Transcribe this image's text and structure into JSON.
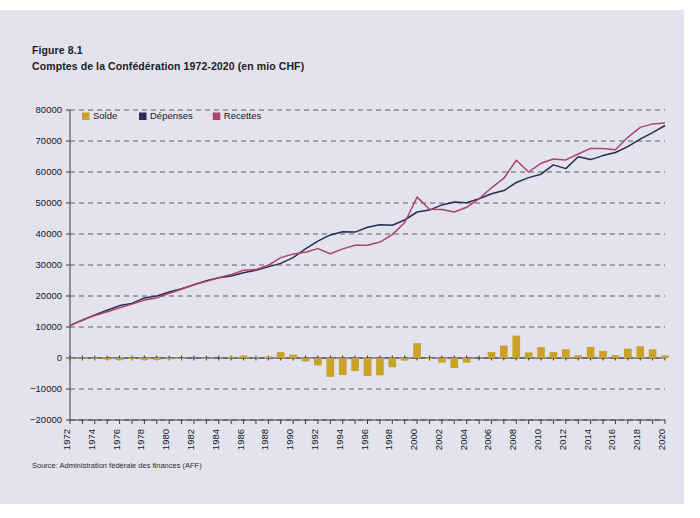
{
  "figure": {
    "label": "Figure 8.1",
    "subtitle": "Comptes de la Confédération 1972-2020 (en mio CHF)",
    "source": "Source: Administration fédérale des finances (AFF)"
  },
  "colors": {
    "solde": "#c9a227",
    "depenses": "#2b2b55",
    "recettes": "#b0436a",
    "page_background": "#e3e3ee",
    "grid": "#3a3a46"
  },
  "legend": {
    "position": "top-left",
    "items": [
      {
        "label": "Solde",
        "color": "#c9a227",
        "type": "bar"
      },
      {
        "label": "Dépenses",
        "color": "#2b2b55",
        "type": "line"
      },
      {
        "label": "Recettes",
        "color": "#b0436a",
        "type": "line"
      }
    ]
  },
  "chart_data": {
    "type": "bar",
    "title": "Comptes de la Confédération 1972-2020 (en mio CHF)",
    "xlabel": "",
    "ylabel": "",
    "ylim": [
      -20000,
      80000
    ],
    "ytick_step": 10000,
    "yticks": [
      -20000,
      -10000,
      0,
      10000,
      20000,
      30000,
      40000,
      50000,
      60000,
      70000,
      80000
    ],
    "ytick_labels": [
      "−20000",
      "−10000",
      "0",
      "10000",
      "20000",
      "30000",
      "40000",
      "50000",
      "60000",
      "70000",
      "80000"
    ],
    "grid": true,
    "xlim": [
      1972,
      2020
    ],
    "xtick_step": 2,
    "xtick_labels": [
      "1972",
      "1974",
      "1976",
      "1978",
      "1980",
      "1982",
      "1984",
      "1986",
      "1988",
      "1990",
      "1992",
      "1994",
      "1996",
      "1998",
      "2000",
      "2002",
      "2004",
      "2006",
      "2008",
      "2010",
      "2012",
      "2014",
      "2016",
      "2018",
      "2020"
    ],
    "x": [
      1972,
      1973,
      1974,
      1975,
      1976,
      1977,
      1978,
      1979,
      1980,
      1981,
      1982,
      1983,
      1984,
      1985,
      1986,
      1987,
      1988,
      1989,
      1990,
      1991,
      1992,
      1993,
      1994,
      1995,
      1996,
      1997,
      1998,
      1999,
      2000,
      2001,
      2002,
      2003,
      2004,
      2005,
      2006,
      2007,
      2008,
      2009,
      2010,
      2011,
      2012,
      2013,
      2014,
      2015,
      2016,
      2017,
      2018,
      2019,
      2020
    ],
    "series": [
      {
        "name": "Dépenses",
        "color": "#2b2b55",
        "type": "line",
        "values": [
          10500,
          12200,
          13900,
          15400,
          16900,
          17600,
          19400,
          20000,
          21300,
          22400,
          23600,
          24900,
          25900,
          26500,
          27500,
          28300,
          29400,
          30500,
          32400,
          35200,
          37700,
          39700,
          40700,
          40600,
          42200,
          43000,
          42800,
          44500,
          47100,
          47700,
          49400,
          50300,
          50100,
          51400,
          53000,
          54000,
          56600,
          58200,
          59300,
          62300,
          61100,
          64900,
          64000,
          65300,
          66300,
          68200,
          70600,
          72700,
          75000
        ]
      },
      {
        "name": "Recettes",
        "color": "#b0436a",
        "type": "line",
        "values": [
          10400,
          12300,
          13700,
          14900,
          16200,
          17400,
          18700,
          19400,
          20900,
          22200,
          23600,
          24700,
          25900,
          26900,
          28300,
          28500,
          29900,
          32400,
          33500,
          34100,
          35300,
          33600,
          35200,
          36400,
          36400,
          37400,
          39800,
          43700,
          51900,
          48000,
          47900,
          47100,
          48600,
          51400,
          54900,
          58000,
          63800,
          60000,
          62800,
          64200,
          63900,
          65800,
          67600,
          67600,
          67200,
          71200,
          74400,
          75500,
          75800
        ]
      },
      {
        "name": "Solde",
        "color": "#c9a227",
        "type": "bar",
        "values": [
          -100,
          100,
          -200,
          -500,
          -700,
          -200,
          -700,
          -600,
          -400,
          -200,
          0,
          -200,
          0,
          400,
          800,
          200,
          500,
          1900,
          1100,
          -1100,
          -2400,
          -6100,
          -5500,
          -4200,
          -5800,
          -5600,
          -3000,
          -800,
          4800,
          -300,
          -1500,
          -3200,
          -1500,
          0,
          1900,
          4000,
          7200,
          1800,
          3500,
          1900,
          2800,
          900,
          3600,
          2300,
          900,
          3000,
          3800,
          2800,
          800
        ]
      }
    ]
  }
}
